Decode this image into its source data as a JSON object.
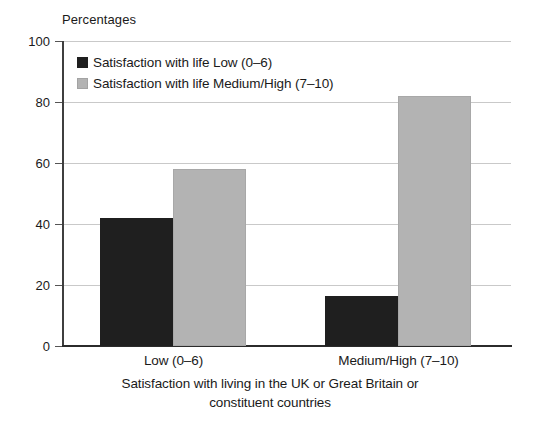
{
  "chart_data": {
    "type": "bar",
    "title": "",
    "ylabel": "Percentages",
    "xlabel": "Satisfaction with living in the UK or Great Britain or constituent countries",
    "categories": [
      "Low (0–6)",
      "Medium/High (7–10)"
    ],
    "series": [
      {
        "name": "Satisfaction with life Low (0–6)",
        "color": "#1f1f1f",
        "values": [
          42,
          16.5
        ]
      },
      {
        "name": "Satisfaction with life Medium/High (7–10)",
        "color": "#b3b3b3",
        "values": [
          58,
          82
        ]
      }
    ],
    "ylim": [
      0,
      100
    ],
    "yticks": [
      0,
      20,
      40,
      60,
      80,
      100
    ],
    "ytick_labels": [
      "0",
      "20",
      "40",
      "60",
      "80",
      "100"
    ],
    "grid": true,
    "legend_position": "top-left"
  },
  "axis": {
    "y_title": "Percentages"
  },
  "legend": {
    "items": [
      {
        "label": "Satisfaction with life Low (0–6)"
      },
      {
        "label": "Satisfaction with life Medium/High (7–10)"
      }
    ]
  },
  "xaxis": {
    "categories": [
      "Low (0–6)",
      "Medium/High (7–10)"
    ],
    "caption_line1": "Satisfaction with living in the UK or Great Britain or",
    "caption_line2": "constituent countries"
  }
}
